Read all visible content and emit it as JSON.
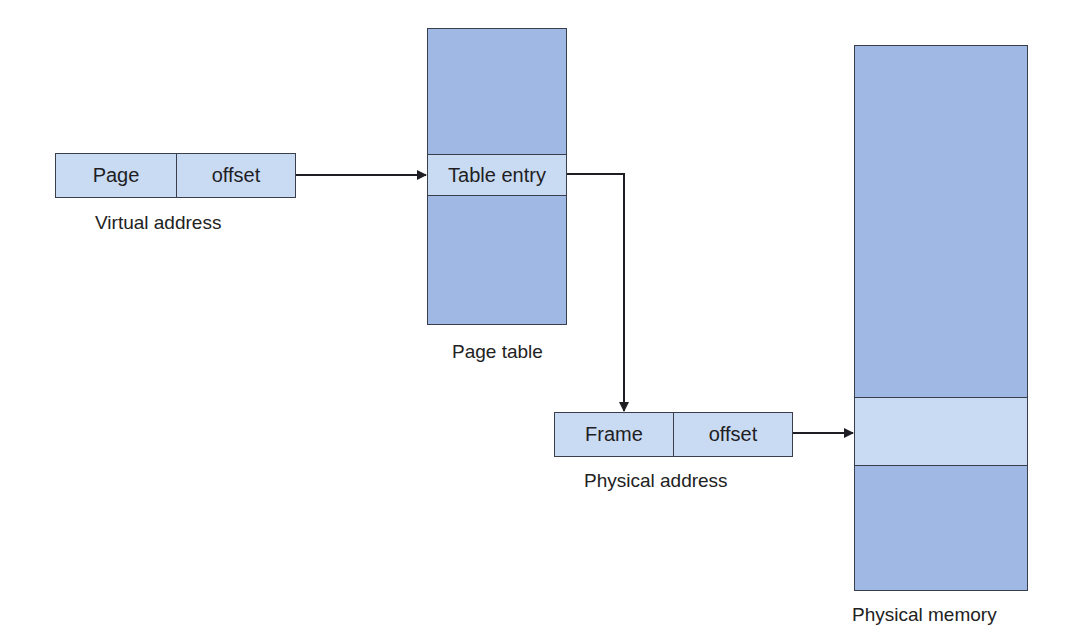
{
  "diagram": {
    "virtual_address": {
      "fields": [
        "Page",
        "offset"
      ],
      "caption": "Virtual address"
    },
    "page_table": {
      "entry_label": "Table entry",
      "caption": "Page table"
    },
    "physical_address": {
      "fields": [
        "Frame",
        "offset"
      ],
      "caption": "Physical address"
    },
    "physical_memory": {
      "caption": "Physical memory"
    },
    "colors": {
      "block_fill": "#9fb9e4",
      "highlight_fill": "#c9daf3",
      "border": "#3a3d4a",
      "arrow": "#1e1e24"
    },
    "edges": [
      {
        "from": "virtual-address",
        "to": "page-table-entry"
      },
      {
        "from": "page-table-entry",
        "to": "physical-address"
      },
      {
        "from": "physical-address",
        "to": "physical-memory-frame"
      }
    ]
  }
}
